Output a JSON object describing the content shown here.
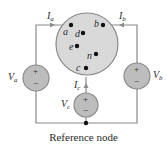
{
  "diagram": {
    "caption": "Reference node",
    "colors": {
      "wire": "#8a8a8a",
      "fill": "#d9d9d9",
      "source_fill": "#bdbdbd",
      "dot": "#111111",
      "text": "#2b2b2b"
    },
    "network_nodes": [
      {
        "id": "a",
        "label": "a"
      },
      {
        "id": "b",
        "label": "b"
      },
      {
        "id": "c",
        "label": "c"
      },
      {
        "id": "d",
        "label": "d"
      },
      {
        "id": "e",
        "label": "e"
      },
      {
        "id": "n",
        "label": "n"
      }
    ],
    "sources": [
      {
        "id": "Va",
        "symbol": "V",
        "subscript": "a",
        "plus": "+",
        "minus": "−"
      },
      {
        "id": "Vb",
        "symbol": "V",
        "subscript": "b",
        "plus": "+",
        "minus": "−"
      },
      {
        "id": "Vc",
        "symbol": "V",
        "subscript": "c",
        "plus": "+",
        "minus": "−"
      }
    ],
    "currents": [
      {
        "id": "Ia",
        "symbol": "I",
        "subscript": "a"
      },
      {
        "id": "Ib",
        "symbol": "I",
        "subscript": "b"
      },
      {
        "id": "Ic",
        "symbol": "I",
        "subscript": "c"
      }
    ]
  }
}
